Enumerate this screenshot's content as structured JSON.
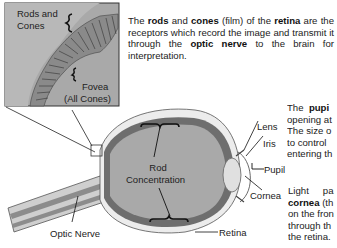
{
  "diagram": {
    "colors": {
      "eyeball_fill": "#a8a8a8",
      "inset_fill": "#a9a9a9",
      "sclera": "#e6e6e6",
      "retina_band": "#7a7a7a",
      "line": "#1a1a1a",
      "text": "#222222"
    },
    "inset": {
      "label_rods_cones_1": "Rods and",
      "label_rods_cones_2": "Cones",
      "label_fovea_1": "Fovea",
      "label_fovea_2": "(All Cones)"
    },
    "labels": {
      "rod_concentration_1": "Rod",
      "rod_concentration_2": "Concentration",
      "lens": "Lens",
      "iris": "Iris",
      "pupil": "Pupil",
      "cornea": "Cornea",
      "retina": "Retina",
      "optic_nerve": "Optic Nerve"
    },
    "paragraphs": {
      "p1": {
        "t1": "The ",
        "b1": "rods",
        "t2": " and ",
        "b2": "cones",
        "t3": " (film) of the ",
        "b3": "retina",
        "t4": " are the receptors which record the image and transmit it through the ",
        "b4": "optic nerve",
        "t5": " to the brain for interpretation."
      },
      "p2": {
        "line1_a": "The ",
        "line1_b": "pupi",
        "line2": "opening at",
        "line3": "The size o",
        "line4": "to control",
        "line5": "entering th"
      },
      "p3": {
        "line1_a": "Light",
        "line1_b": "pa",
        "line2_b": "cornea",
        "line2_t": " (th",
        "line3": "on the fron",
        "line4": "through th",
        "line5": "the retina."
      }
    }
  }
}
